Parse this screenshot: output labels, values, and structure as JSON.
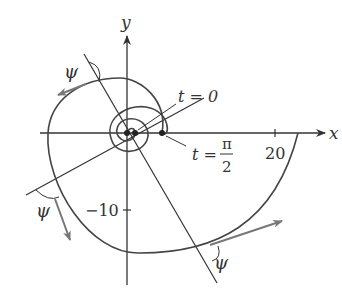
{
  "figure": {
    "type": "logarithmic-spiral-diagram",
    "colors": {
      "curve": "#444444",
      "axes": "#333333",
      "tangent_arrow": "#777777",
      "text": "#333333"
    }
  },
  "axes": {
    "x_label": "x",
    "y_label": "y",
    "x_tick_label": "20",
    "y_tick_label": "−10"
  },
  "annotations": {
    "t0_label": "t = 0",
    "t_label": "t =",
    "pi_half_num": "π",
    "pi_half_den": "2",
    "angle_label": "ψ"
  }
}
